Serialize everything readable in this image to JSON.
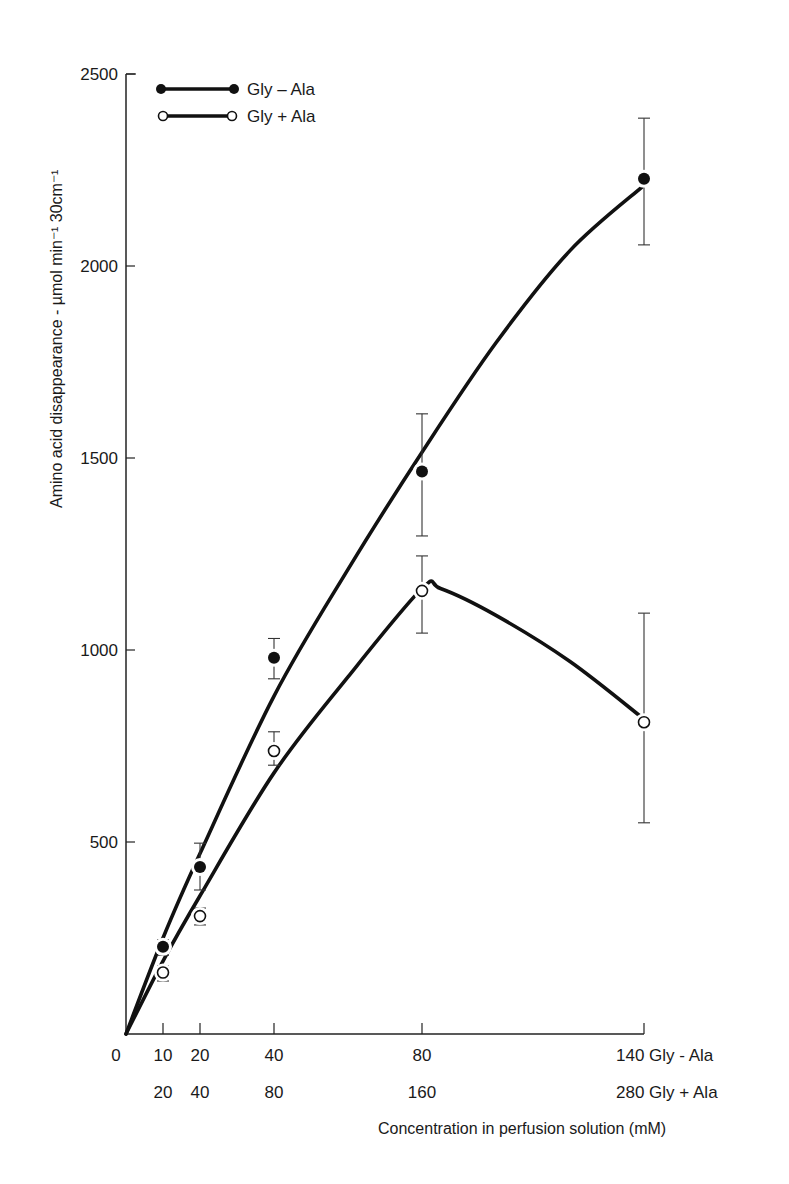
{
  "chart_data": {
    "type": "line",
    "title": "",
    "xlabel": "Concentration in perfusion solution (mM)",
    "ylabel": "Amino acid disappearance - µmol min⁻¹ 30cm⁻¹",
    "ylim": [
      0,
      2500
    ],
    "xlim": [
      0,
      140
    ],
    "grid": false,
    "legend_position": "top-left",
    "y_ticks": [
      500,
      1000,
      1500,
      2000,
      2500
    ],
    "x_ticks_row1": [
      "0",
      "10",
      "20",
      "40",
      "80",
      "140 Gly - Ala"
    ],
    "x_ticks_row2": [
      "20",
      "40",
      "80",
      "160",
      "280 Gly + Ala"
    ],
    "x_tick_positions": [
      0,
      10,
      20,
      40,
      80,
      140
    ],
    "series": [
      {
        "name": "Gly - Ala",
        "marker": "filled-circle",
        "x": [
          10,
          20,
          40,
          80,
          140
        ],
        "values": [
          227,
          435,
          980,
          1465,
          2227
        ],
        "error_low": [
          205,
          375,
          925,
          1297,
          2055
        ],
        "error_high": [
          245,
          497,
          1030,
          1615,
          2385
        ],
        "fitted_curve": [
          [
            0,
            0
          ],
          [
            10,
            250
          ],
          [
            20,
            470
          ],
          [
            40,
            880
          ],
          [
            60,
            1210
          ],
          [
            80,
            1515
          ],
          [
            100,
            1800
          ],
          [
            120,
            2040
          ],
          [
            140,
            2210
          ]
        ]
      },
      {
        "name": "Gly + Ala",
        "marker": "open-circle",
        "x": [
          10,
          20,
          40,
          80,
          140
        ],
        "values": [
          160,
          307,
          737,
          1154,
          812
        ],
        "error_low": [
          138,
          284,
          700,
          1044,
          550
        ],
        "error_high": [
          177,
          328,
          787,
          1245,
          1096
        ],
        "x_alt": [
          20,
          40,
          80,
          160,
          280
        ],
        "fitted_curve": [
          [
            0,
            0
          ],
          [
            10,
            190
          ],
          [
            20,
            360
          ],
          [
            40,
            680
          ],
          [
            60,
            930
          ],
          [
            80,
            1160
          ],
          [
            85,
            1160
          ],
          [
            100,
            1090
          ],
          [
            120,
            970
          ],
          [
            140,
            820
          ]
        ]
      }
    ]
  },
  "legend": {
    "items": [
      {
        "label": "Gly – Ala",
        "marker": "filled-circle"
      },
      {
        "label": "Gly + Ala",
        "marker": "open-circle"
      }
    ]
  },
  "axes": {
    "y_title": "Amino acid disappearance - µmol min⁻¹  30cm⁻¹",
    "x_title": "Concentration in perfusion solution (mM)"
  }
}
